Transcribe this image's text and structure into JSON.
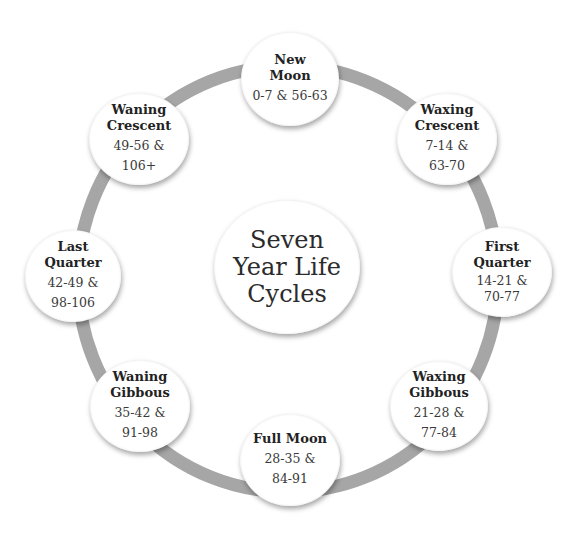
{
  "diagram": {
    "type": "cycle",
    "ring_color": "#a6a6a6",
    "center": {
      "label_lines": [
        "Seven",
        "Year Life",
        "Cycles"
      ]
    },
    "phases": [
      {
        "id": "new-moon",
        "title_lines": [
          "New",
          "Moon"
        ],
        "range_lines": [
          "0-7 & 56-63"
        ]
      },
      {
        "id": "waxing-crescent",
        "title_lines": [
          "Waxing",
          "Crescent"
        ],
        "range_lines": [
          "7-14 &",
          "63-70"
        ]
      },
      {
        "id": "first-quarter",
        "title_lines": [
          "First",
          "Quarter"
        ],
        "range_lines": [
          "14-21 &",
          "70-77"
        ]
      },
      {
        "id": "waxing-gibbous",
        "title_lines": [
          "Waxing",
          "Gibbous"
        ],
        "range_lines": [
          "21-28 &",
          "77-84"
        ]
      },
      {
        "id": "full-moon",
        "title_lines": [
          "Full Moon"
        ],
        "range_lines": [
          "28-35 &",
          "84-91"
        ]
      },
      {
        "id": "waning-gibbous",
        "title_lines": [
          "Waning",
          "Gibbous"
        ],
        "range_lines": [
          "35-42 &",
          "91-98"
        ]
      },
      {
        "id": "last-quarter",
        "title_lines": [
          "Last",
          "Quarter"
        ],
        "range_lines": [
          "42-49 &",
          "98-106"
        ]
      },
      {
        "id": "waning-crescent",
        "title_lines": [
          "Waning",
          "Crescent"
        ],
        "range_lines": [
          "49-56 &",
          "106+"
        ]
      }
    ]
  }
}
